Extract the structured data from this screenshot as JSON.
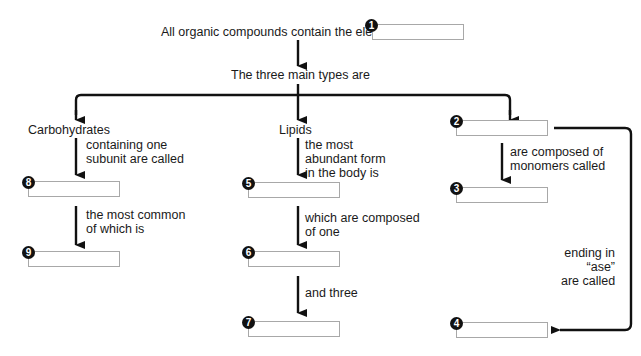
{
  "diagram": {
    "root_text": "All organic compounds contain the element",
    "types_text": "The three main types are",
    "branches": {
      "carbohydrates": {
        "label": "Carbohydrates",
        "step1": [
          "containing one",
          "subunit are called"
        ],
        "step2": [
          "the most common",
          "of which is"
        ]
      },
      "lipids": {
        "label": "Lipids",
        "step1": [
          "the most",
          "abundant form",
          "in the body is"
        ],
        "step2": [
          "which are composed",
          "of one"
        ],
        "step3": [
          "and three"
        ]
      },
      "third": {
        "step1": [
          "are composed of",
          "monomers called"
        ],
        "step2": [
          "ending in",
          "“ase”",
          "are called"
        ]
      }
    },
    "blanks": {
      "b1": {
        "number": "1",
        "value": ""
      },
      "b2": {
        "number": "2",
        "value": ""
      },
      "b3": {
        "number": "3",
        "value": ""
      },
      "b4": {
        "number": "4",
        "value": ""
      },
      "b5": {
        "number": "5",
        "value": ""
      },
      "b6": {
        "number": "6",
        "value": ""
      },
      "b7": {
        "number": "7",
        "value": ""
      },
      "b8": {
        "number": "8",
        "value": ""
      },
      "b9": {
        "number": "9",
        "value": ""
      }
    },
    "colors": {
      "arrow": "#111111",
      "box_border": "#a8a8a8",
      "badge": "#111111"
    }
  }
}
